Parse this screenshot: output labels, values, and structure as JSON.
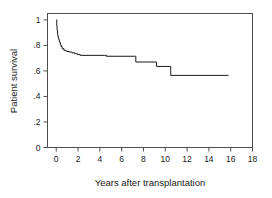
{
  "chart_data": {
    "type": "line",
    "subtype": "kaplan-meier-step",
    "title": "",
    "xlabel": "Years after transplantation",
    "ylabel": "Patient survival",
    "xlim": [
      -0.8,
      18
    ],
    "ylim": [
      0,
      1.05
    ],
    "xticks": [
      0,
      2,
      4,
      6,
      8,
      10,
      12,
      14,
      16,
      18
    ],
    "xtick_labels": [
      "0",
      "2",
      "4",
      "6",
      "8",
      "10",
      "12",
      "14",
      "16",
      "18"
    ],
    "yticks": [
      0,
      0.2,
      0.4,
      0.6,
      0.8,
      1
    ],
    "ytick_labels": [
      "0",
      ".2",
      ".4",
      ".6",
      ".8",
      "1"
    ],
    "grid": false,
    "legend": null,
    "line_color": "#1a1a1a",
    "line_width": 1.0,
    "frame_color": "#4d4d4d",
    "series": [
      {
        "name": "Patient survival",
        "x": [
          0.0,
          0.05,
          0.08,
          0.12,
          0.15,
          0.2,
          0.25,
          0.3,
          0.38,
          0.45,
          0.55,
          0.7,
          0.85,
          1.0,
          1.2,
          1.45,
          1.7,
          1.95,
          2.2,
          4.45,
          4.6,
          7.15,
          7.3,
          9.0,
          9.2,
          10.35,
          10.5,
          15.8
        ],
        "y": [
          1.0,
          0.95,
          0.92,
          0.89,
          0.87,
          0.855,
          0.84,
          0.825,
          0.805,
          0.79,
          0.775,
          0.762,
          0.757,
          0.752,
          0.748,
          0.742,
          0.735,
          0.728,
          0.722,
          0.722,
          0.715,
          0.715,
          0.67,
          0.67,
          0.635,
          0.635,
          0.565,
          0.565
        ]
      }
    ]
  },
  "axes": {
    "y_title": "Patient survival",
    "x_title": "Years after transplantation"
  }
}
